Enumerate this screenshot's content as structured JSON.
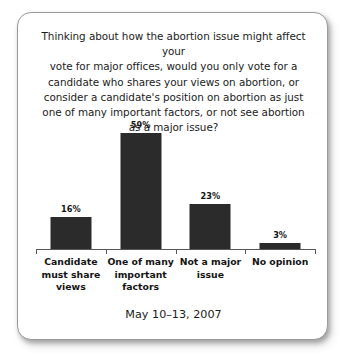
{
  "card": {
    "background": "#ffffff",
    "border_color": "#9a9a9a"
  },
  "chart_data": {
    "type": "bar",
    "title_lines": [
      "Thinking about how the abortion issue might affect your",
      "vote for major offices, would you only vote for a",
      "candidate who shares your views on abortion, or",
      "consider a candidate's position on abortion as just",
      "one of many important factors, or not see abortion",
      "as a major issue?"
    ],
    "categories": [
      "Candidate must share views",
      "One of many important factors",
      "Not a major issue",
      "No opinion"
    ],
    "category_lines": [
      [
        "Candidate",
        "must share",
        "views"
      ],
      [
        "One of many",
        "important",
        "factors"
      ],
      [
        "Not a major",
        "issue"
      ],
      [
        "No opinion"
      ]
    ],
    "values": [
      16,
      59,
      23,
      3
    ],
    "value_labels": [
      "16%",
      "59%",
      "23%",
      "3%"
    ],
    "xlabel": "",
    "ylabel": "",
    "ylim": [
      0,
      65
    ],
    "grid": false,
    "legend": false,
    "bar_color": "#2b2b2b",
    "axis_color": "#55585a"
  },
  "footer": {
    "date": "May 10–13, 2007"
  }
}
